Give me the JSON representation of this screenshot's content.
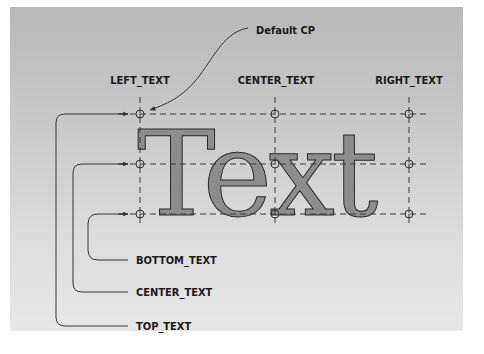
{
  "figure": {
    "sample_text": "Text",
    "callout": "Default CP",
    "horizontal_labels": [
      "LEFT_TEXT",
      "CENTER_TEXT",
      "RIGHT_TEXT"
    ],
    "vertical_labels": [
      "BOTTOM_TEXT",
      "CENTER_TEXT",
      "TOP_TEXT"
    ],
    "colors": {
      "glyph_fill": "#8d8d8d",
      "background_top": "#b9b9b9",
      "background_bottom": "#e7e7e7",
      "line": "#333333"
    }
  }
}
